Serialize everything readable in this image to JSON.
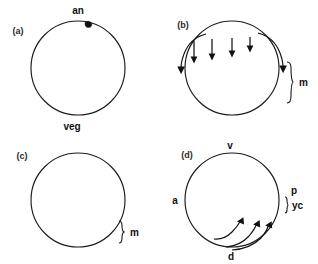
{
  "figure": {
    "background_color": "#ffffff",
    "ink_color": "#111111",
    "width": 318,
    "height": 264
  },
  "panels": [
    {
      "id": "a",
      "label": "(a)",
      "label_x": 18,
      "label_y": 34,
      "circle": {
        "cx": 78,
        "cy": 68,
        "r": 47
      },
      "description": "uniformly stippled egg with polar body at animal pole",
      "annotations": [
        {
          "name": "animal-pole-label",
          "text": "an",
          "x": 78,
          "y": 14
        },
        {
          "name": "vegetal-pole-label",
          "text": "veg",
          "x": 72,
          "y": 128
        }
      ],
      "polar_body": {
        "cx": 88,
        "cy": 24,
        "r": 3.2
      }
    },
    {
      "id": "b",
      "label": "(b)",
      "label_x": 183,
      "label_y": 28,
      "circle": {
        "cx": 232,
        "cy": 68,
        "r": 47
      },
      "description": "stippled mesoplasm forming wavy front in lower half, arrows streaming downward",
      "straight_arrow_count": 4,
      "curved_arrow_count": 2,
      "bracket": {
        "label": "m",
        "label_x": 303,
        "label_y": 83,
        "top_y": 62,
        "bottom_y": 103,
        "x": 288
      }
    },
    {
      "id": "c",
      "label": "(c)",
      "label_x": 22,
      "label_y": 159,
      "circle": {
        "cx": 78,
        "cy": 200,
        "r": 47
      },
      "description": "small stippled mound of mesoplasm at vegetal pole",
      "bracket": {
        "label": "m",
        "label_x": 130,
        "label_y": 233,
        "top_y": 222,
        "bottom_y": 243,
        "x": 120
      }
    },
    {
      "id": "d",
      "label": "(d)",
      "label_x": 187,
      "label_y": 158,
      "circle": {
        "cx": 232,
        "cy": 200,
        "r": 47
      },
      "description": "yolky crescent wedge at posterior, arrows sweeping from ventral-dorsal into crescent",
      "curved_arrow_count": 3,
      "annotations": [
        {
          "name": "ventral-label",
          "text": "v",
          "x": 230,
          "y": 147
        },
        {
          "name": "anterior-label",
          "text": "a",
          "x": 175,
          "y": 201
        },
        {
          "name": "dorsal-label",
          "text": "d",
          "x": 231,
          "y": 258
        },
        {
          "name": "posterior-label",
          "text": "p",
          "x": 293,
          "y": 191
        }
      ],
      "bracket": {
        "label": "yc",
        "label_x": 293,
        "label_y": 206,
        "top_y": 197,
        "bottom_y": 214,
        "x": 285
      }
    }
  ],
  "legend_keys": [
    {
      "key": "an",
      "meaning": "animal pole"
    },
    {
      "key": "veg",
      "meaning": "vegetal pole"
    },
    {
      "key": "m",
      "meaning": "mesoplasm"
    },
    {
      "key": "v",
      "meaning": "ventral"
    },
    {
      "key": "a",
      "meaning": "anterior"
    },
    {
      "key": "d",
      "meaning": "dorsal"
    },
    {
      "key": "p",
      "meaning": "posterior"
    },
    {
      "key": "yc",
      "meaning": "yellow crescent"
    }
  ]
}
